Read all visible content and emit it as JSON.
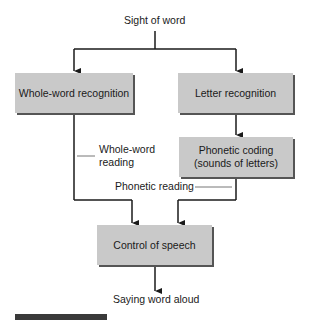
{
  "diagram": {
    "top_label": "Sight of word",
    "bottom_label": "Saying word aloud",
    "nodes": {
      "whole_word": "Whole-word recognition",
      "letter": "Letter recognition",
      "phonetic_line1": "Phonetic coding",
      "phonetic_line2": "(sounds of letters)",
      "speech": "Control of speech"
    },
    "edge_labels": {
      "whole_word_reading_1": "Whole-word",
      "whole_word_reading_2": "reading",
      "phonetic_reading": "Phonetic reading"
    },
    "colors": {
      "box_fill": "#c9c9c9",
      "line": "#1a1a1a",
      "shadow": "#555555"
    }
  }
}
